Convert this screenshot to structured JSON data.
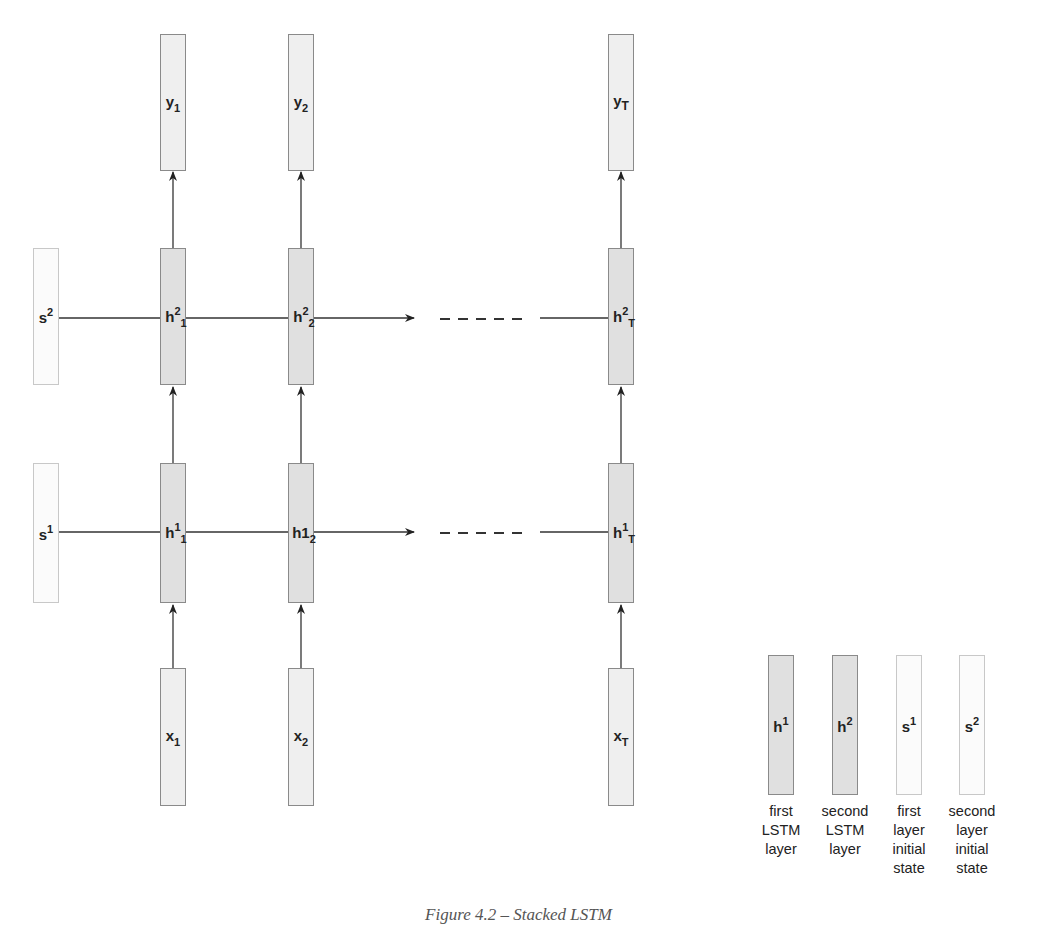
{
  "diagram": {
    "title": "Stacked LSTM",
    "columns": [
      "1",
      "2",
      "T"
    ],
    "outputs": [
      {
        "base": "y",
        "sub": "1"
      },
      {
        "base": "y",
        "sub": "2"
      },
      {
        "base": "y",
        "sub": "T"
      }
    ],
    "layer2": [
      {
        "base": "h",
        "sup": "2",
        "sub": "1"
      },
      {
        "base": "h",
        "sup": "2",
        "sub": "2"
      },
      {
        "base": "h",
        "sup": "2",
        "sub": "T"
      }
    ],
    "layer1": [
      {
        "base": "h",
        "sup": "1",
        "sub": "1"
      },
      {
        "base": "h1",
        "sup": "",
        "sub": "2"
      },
      {
        "base": "h",
        "sup": "1",
        "sub": "T"
      }
    ],
    "inputs": [
      {
        "base": "x",
        "sub": "1"
      },
      {
        "base": "x",
        "sub": "2"
      },
      {
        "base": "x",
        "sub": "T"
      }
    ],
    "initial_states": [
      {
        "base": "s",
        "sup": "2"
      },
      {
        "base": "s",
        "sup": "1"
      }
    ],
    "ellipsis": "------",
    "colors": {
      "lstm_fill": "#e0e0e0",
      "io_fill": "#efefef",
      "state_fill": "#fbfbfb",
      "stroke": "#333333"
    }
  },
  "legend": {
    "items": [
      {
        "box_base": "h",
        "box_sup": "1",
        "lines": [
          "first",
          "LSTM",
          "layer"
        ]
      },
      {
        "box_base": "h",
        "box_sup": "2",
        "lines": [
          "second",
          "LSTM",
          "layer"
        ]
      },
      {
        "box_base": "s",
        "box_sup": "1",
        "lines": [
          "first",
          "layer",
          "initial",
          "state"
        ]
      },
      {
        "box_base": "s",
        "box_sup": "2",
        "lines": [
          "second",
          "layer",
          "initial",
          "state"
        ]
      }
    ]
  },
  "caption": "Figure 4.2 – Stacked LSTM"
}
